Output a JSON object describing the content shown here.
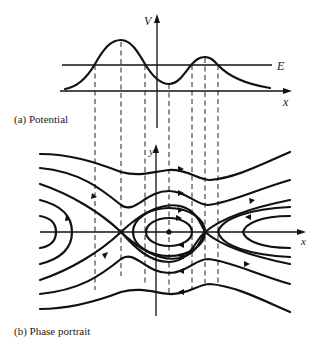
{
  "figure": {
    "panel_a": {
      "caption": "(a)  Potential",
      "y_axis_label": "V",
      "x_axis_label": "x",
      "energy_label": "E"
    },
    "panel_b": {
      "caption": "(b)  Phase portrait",
      "y_axis_label": "y",
      "x_axis_label": "x"
    }
  },
  "colors": {
    "ink": "#111111",
    "background": "#ffffff"
  }
}
